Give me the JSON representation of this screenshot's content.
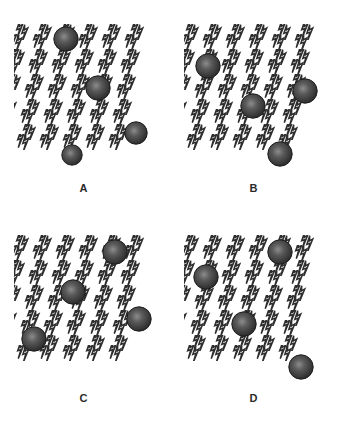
{
  "figure": {
    "background_color": "#ffffff",
    "width": 340,
    "height": 423,
    "bolt_color": "#2e2e2e",
    "bolt_fill": "#ffffff",
    "sphere_color_light": "#8c8c8c",
    "sphere_color_mid": "#5a5a5a",
    "sphere_color_dark": "#2a2a2a",
    "sphere_outline": "#1e1e1e"
  },
  "pattern": {
    "icon_name": "lightning-bolt-icon",
    "icon_count_per_panel": 30,
    "columns": 6,
    "rows": 5,
    "cell_width": 23,
    "cell_height": 25,
    "row_offset_x": -4,
    "bolt_width": 18,
    "bolt_height": 16,
    "bolt_rotation_deg": -28
  },
  "panels": [
    {
      "id": "A",
      "label": "A",
      "x": 14,
      "y": 23,
      "width": 139,
      "height": 152,
      "label_x": 14,
      "label_y": 182,
      "sphere_count": 4,
      "spheres": [
        {
          "cx": 52,
          "cy": 16,
          "r": 13
        },
        {
          "cx": 84,
          "cy": 65,
          "r": 13
        },
        {
          "cx": 122,
          "cy": 110,
          "r": 12
        },
        {
          "cx": 58,
          "cy": 132,
          "r": 11
        }
      ]
    },
    {
      "id": "B",
      "label": "B",
      "x": 184,
      "y": 23,
      "width": 139,
      "height": 152,
      "label_x": 184,
      "label_y": 182,
      "sphere_count": 4,
      "spheres": [
        {
          "cx": 24,
          "cy": 43,
          "r": 13
        },
        {
          "cx": 121,
          "cy": 68,
          "r": 13
        },
        {
          "cx": 69,
          "cy": 83,
          "r": 13
        },
        {
          "cx": 96,
          "cy": 131,
          "r": 13
        }
      ]
    },
    {
      "id": "C",
      "label": "C",
      "x": 14,
      "y": 234,
      "width": 139,
      "height": 152,
      "label_x": 14,
      "label_y": 392,
      "sphere_count": 4,
      "spheres": [
        {
          "cx": 101,
          "cy": 18,
          "r": 13
        },
        {
          "cx": 59,
          "cy": 58,
          "r": 13
        },
        {
          "cx": 125,
          "cy": 85,
          "r": 13
        },
        {
          "cx": 20,
          "cy": 105,
          "r": 13
        }
      ]
    },
    {
      "id": "D",
      "label": "D",
      "x": 184,
      "y": 234,
      "width": 139,
      "height": 152,
      "label_x": 184,
      "label_y": 392,
      "sphere_count": 4,
      "spheres": [
        {
          "cx": 96,
          "cy": 18,
          "r": 13
        },
        {
          "cx": 22,
          "cy": 43,
          "r": 13
        },
        {
          "cx": 60,
          "cy": 90,
          "r": 13
        },
        {
          "cx": 117,
          "cy": 133,
          "r": 13
        }
      ]
    }
  ]
}
